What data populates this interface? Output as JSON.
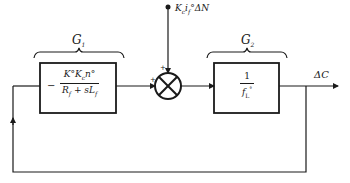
{
  "diagram": {
    "type": "block-diagram",
    "blocks": [
      {
        "id": "G1",
        "label": "G",
        "label_sub": "1",
        "sign": "−",
        "numerator": "K°K",
        "numerator_sub": "c",
        "numerator_tail": "n°",
        "denominator": "R",
        "denominator_sub": "f",
        "denominator_mid": " + sL",
        "denominator_sub2": "f"
      },
      {
        "id": "G2",
        "label": "G",
        "label_sub": "2",
        "numerator": "1",
        "denominator": "f",
        "denominator_sub": "L",
        "denominator_sup": "°"
      }
    ],
    "summing_junction": {
      "input_signs": [
        "+",
        "+"
      ]
    },
    "disturbance_input": {
      "label": "K",
      "label_sub": "c",
      "label_mid": "i",
      "label_sub2": "f",
      "label_tail": "°ΔN"
    },
    "output": {
      "label": "ΔC"
    },
    "colors": {
      "line": "#1a1a1a",
      "background": "#ffffff"
    }
  }
}
